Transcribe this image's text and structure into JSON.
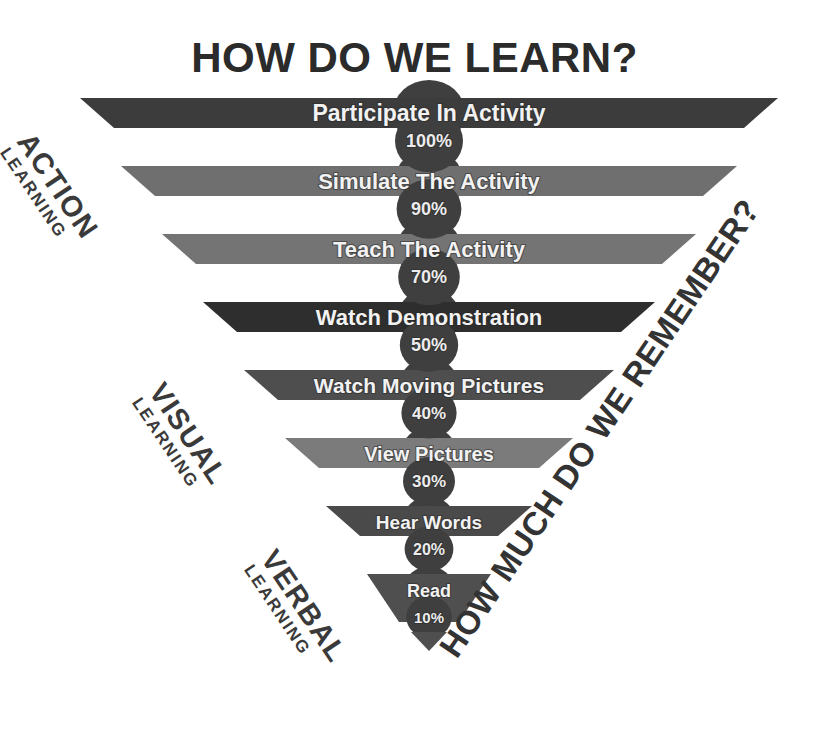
{
  "title": "HOW DO WE LEARN?",
  "right_label": "HOW MUCH DO WE REMEMBER?",
  "categories": [
    {
      "name": "action",
      "big": "ACTION",
      "small": "LEARNING"
    },
    {
      "name": "visual",
      "big": "VISUAL",
      "small": "LEARNING"
    },
    {
      "name": "verbal",
      "big": "VERBAL",
      "small": "LEARNING"
    }
  ],
  "chart_data": {
    "type": "bar",
    "title": "HOW DO WE LEARN?",
    "xlabel": "",
    "ylabel": "",
    "orientation": "inverted-pyramid",
    "categories": [
      "Participate In Activity",
      "Simulate The Activity",
      "Teach The Activity",
      "Watch Demonstration",
      "Watch Moving Pictures",
      "View Pictures",
      "Hear Words",
      "Read"
    ],
    "values": [
      100,
      90,
      70,
      50,
      40,
      30,
      20,
      10
    ],
    "value_labels": [
      "100%",
      "90%",
      "70%",
      "50%",
      "40%",
      "30%",
      "20%",
      "10%"
    ],
    "groups": [
      {
        "label": "ACTION LEARNING",
        "items": [
          "Participate In Activity",
          "Simulate The Activity",
          "Teach The Activity"
        ]
      },
      {
        "label": "VISUAL LEARNING",
        "items": [
          "Watch Demonstration",
          "Watch Moving Pictures",
          "View Pictures"
        ]
      },
      {
        "label": "VERBAL LEARNING",
        "items": [
          "Hear Words",
          "Read"
        ]
      }
    ],
    "colors": [
      "#3c3c3c",
      "#6f6f6f",
      "#747474",
      "#2e2e2e",
      "#4e4e4e",
      "#7b7b7b",
      "#4a4a4a",
      "#4f4f4f"
    ],
    "grid": false,
    "legend": "none"
  },
  "bars": [
    {
      "label": "Participate In Activity",
      "pct": "100%",
      "color": "#3c3c3c"
    },
    {
      "label": "Simulate The Activity",
      "pct": "90%",
      "color": "#6f6f6f"
    },
    {
      "label": "Teach The Activity",
      "pct": "70%",
      "color": "#747474"
    },
    {
      "label": "Watch Demonstration",
      "pct": "50%",
      "color": "#2e2e2e"
    },
    {
      "label": "Watch Moving Pictures",
      "pct": "40%",
      "color": "#4e4e4e"
    },
    {
      "label": "View Pictures",
      "pct": "30%",
      "color": "#7b7b7b"
    },
    {
      "label": "Hear Words",
      "pct": "20%",
      "color": "#4a4a4a"
    },
    {
      "label": "Read",
      "pct": "10%",
      "color": "#4f4f4f"
    }
  ]
}
